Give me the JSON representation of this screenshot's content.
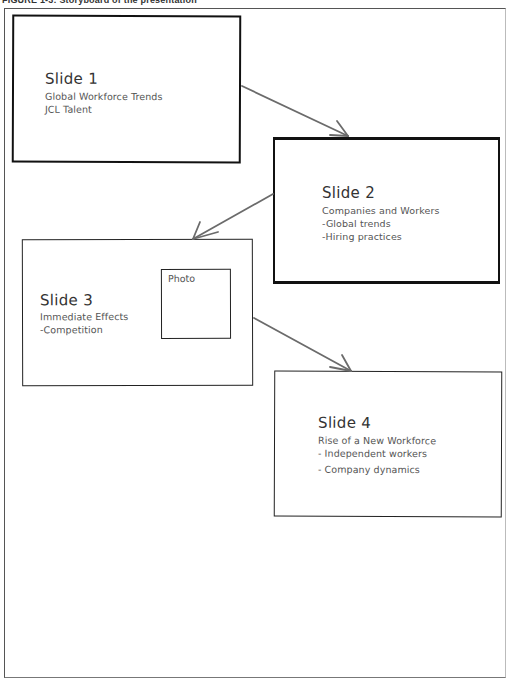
{
  "figure": {
    "caption": "FIGURE 1-3: Storyboard of the presentation"
  },
  "slides": [
    {
      "title": "Slide 1",
      "lines": [
        "Global Workforce Trends",
        "JCL Talent"
      ]
    },
    {
      "title": "Slide 2",
      "lines": [
        "Companies and Workers",
        "-Global trends",
        "-Hiring practices"
      ]
    },
    {
      "title": "Slide 3",
      "lines": [
        "Immediate Effects",
        "-Competition"
      ],
      "placeholder": "Photo"
    },
    {
      "title": "Slide 4",
      "lines": [
        "Rise of a New Workforce",
        "- Independent workers",
        "- Company dynamics"
      ]
    }
  ],
  "connections": [
    {
      "from": "Slide 1",
      "to": "Slide 2"
    },
    {
      "from": "Slide 2",
      "to": "Slide 3"
    },
    {
      "from": "Slide 3",
      "to": "Slide 4"
    }
  ],
  "colors": {
    "box_border": "#111111",
    "arrow": "#6b6b6b",
    "text": "#555555"
  }
}
